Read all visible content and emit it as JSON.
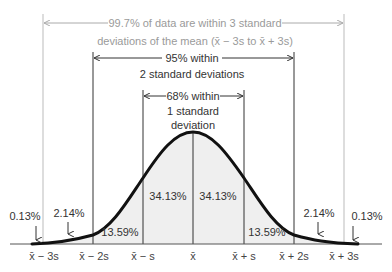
{
  "annotations": {
    "outer": {
      "line1": "99.7% of data are within 3 standard",
      "line2": "deviations of the mean (x̄ − 3s to x̄ + 3s)"
    },
    "middle": {
      "line1": "95% within",
      "line2": "2 standard deviations"
    },
    "inner": {
      "line1": "68% within",
      "line2": "1 standard",
      "line3": "deviation"
    }
  },
  "regions": {
    "left_tail": "0.13%",
    "left_2_3": "2.14%",
    "left_1_2": "13.59%",
    "left_0_1": "34.13%",
    "right_0_1": "34.13%",
    "right_1_2": "13.59%",
    "right_2_3": "2.14%",
    "right_tail": "0.13%"
  },
  "axis": {
    "ticks": [
      "x̄ − 3s",
      "x̄ − 2s",
      "x̄ − s",
      "x̄",
      "x̄ + s",
      "x̄ + 2s",
      "x̄ + 3s"
    ]
  },
  "colors": {
    "fill": "#efefef",
    "curve": "#111111",
    "guide_light": "#b5b5b5",
    "guide_dark": "#333333"
  }
}
